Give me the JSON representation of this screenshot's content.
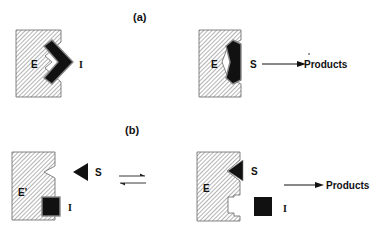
{
  "panels": {
    "a": {
      "label": "(a)",
      "left": {
        "enzyme_label": "E",
        "inhibitor_label": "I"
      },
      "right": {
        "enzyme_label": "E",
        "substrate_label": "S",
        "product_label": "Products"
      }
    },
    "b": {
      "label": "(b)",
      "left": {
        "enzyme_label": "E'",
        "substrate_label": "S",
        "inhibitor_label": "I"
      },
      "right": {
        "enzyme_label": "E",
        "substrate_label": "S",
        "inhibitor_label": "I",
        "product_label": "Products"
      },
      "equilibrium_symbol": "⇌"
    }
  },
  "colors": {
    "hatch": "#555555",
    "fill_dark": "#111111",
    "outline": "#777777",
    "background": "#ffffff"
  }
}
